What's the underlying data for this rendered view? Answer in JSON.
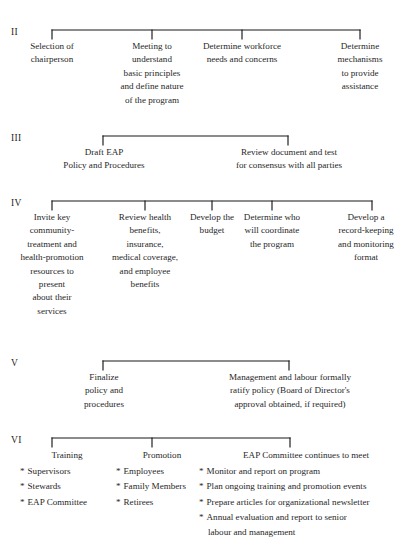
{
  "diagram": {
    "top_cut_text": "",
    "line_color": "#18181a",
    "text_color": "#1f1f1f",
    "background_color": "#ffffff",
    "sections": [
      {
        "numeral": "II",
        "columns": [
          {
            "lines": [
              "Selection of",
              "chairperson"
            ]
          },
          {
            "lines": [
              "Meeting to",
              "understand",
              "basic principles",
              "and define nature",
              "of the program"
            ]
          },
          {
            "lines": [
              "Determine workforce",
              "needs and concerns"
            ]
          },
          {
            "lines": [
              "Determine",
              "mechanisms",
              "to provide",
              "assistance"
            ]
          }
        ]
      },
      {
        "numeral": "III",
        "columns": [
          {
            "lines": [
              "Draft EAP",
              "Policy and Procedures"
            ]
          },
          {
            "lines": [
              "Review document and test",
              "for consensus with all parties"
            ]
          }
        ]
      },
      {
        "numeral": "IV",
        "columns": [
          {
            "lines": [
              "Invite key",
              "community-",
              "treatment and",
              "health-promotion",
              "resources to",
              "present",
              "about their",
              "services"
            ]
          },
          {
            "lines": [
              "Review health",
              "benefits,",
              "insurance,",
              "medical coverage,",
              "and employee",
              "benefits"
            ]
          },
          {
            "lines": [
              "Develop the",
              "budget"
            ]
          },
          {
            "lines": [
              "Determine who",
              "will coordinate",
              "the program"
            ]
          },
          {
            "lines": [
              "Develop a",
              "record-keeping",
              "and monitoring",
              "format"
            ]
          }
        ]
      },
      {
        "numeral": "V",
        "columns": [
          {
            "lines": [
              "Finalize",
              "policy and",
              "procedures"
            ]
          },
          {
            "lines": [
              "Management and labour formally",
              "ratify policy (Board of Director's",
              "approval obtained, if required)"
            ]
          }
        ]
      },
      {
        "numeral": "VI",
        "bullet_marker": "*",
        "columns": [
          {
            "heading": "Training",
            "bullets": [
              "Supervisors",
              "Stewards",
              "EAP Committee"
            ]
          },
          {
            "heading": "Promotion",
            "bullets": [
              "Employees",
              "Family Members",
              "Retirees"
            ]
          },
          {
            "heading": "EAP Committee continues to meet",
            "bullets": [
              "Monitor and report on program",
              "Plan ongoing training and promotion events",
              "Prepare articles for organizational newsletter",
              "Annual evaluation and report to senior"
            ],
            "continuation": "labour and management"
          }
        ]
      }
    ]
  }
}
